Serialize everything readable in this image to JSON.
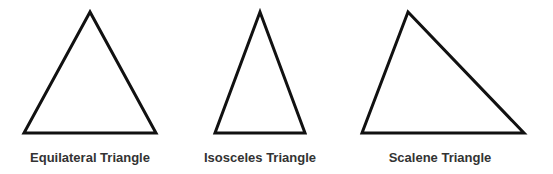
{
  "diagram": {
    "stroke_color": "#111111",
    "stroke_width": 3,
    "triangles": [
      {
        "name": "equilateral",
        "label": "Equilateral Triangle",
        "points": "90,12 24,133 156,133",
        "label_x": 90
      },
      {
        "name": "isosceles",
        "label": "Isosceles Triangle",
        "points": "260,12 215,133 305,133",
        "label_x": 260
      },
      {
        "name": "scalene",
        "label": "Scalene Triangle",
        "points": "408,12 362,133 524,133",
        "label_x": 440
      }
    ]
  }
}
